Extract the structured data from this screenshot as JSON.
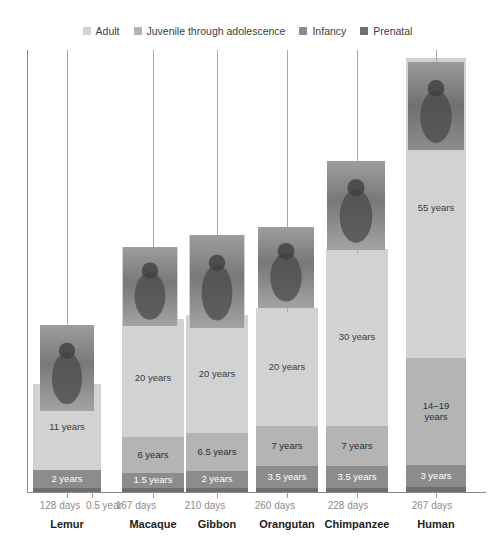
{
  "legend": {
    "items": [
      {
        "label": "Adult",
        "color": "#d2d2d2",
        "name": "adult"
      },
      {
        "label": "Juvenile through adolescence",
        "color": "#b4b4b4",
        "name": "juvenile"
      },
      {
        "label": "Infancy",
        "color": "#8c8c8c",
        "name": "infancy"
      },
      {
        "label": "Prenatal",
        "color": "#6e6e6e",
        "name": "prenatal"
      }
    ]
  },
  "axis": {
    "line_color": "#8a8a8a",
    "tick_color": "#9a9a9a"
  },
  "colors": {
    "adult": "#d2d2d2",
    "juvenile": "#b4b4b4",
    "infancy": "#8c8c8c",
    "prenatal": "#6e6e6e",
    "background": "#ffffff",
    "text": "#3b3b3b",
    "muted_text": "#8d8d8d",
    "leader": "#a8a8a8"
  },
  "chart_data": {
    "type": "bar",
    "subtype": "stacked-bar",
    "title": "",
    "xlabel": "",
    "ylabel": "",
    "grid": false,
    "legend_position": "top-center",
    "unit": "years",
    "categories": [
      "Lemur",
      "Macaque",
      "Gibbon",
      "Orangutan",
      "Chimpanzee",
      "Human"
    ],
    "series": [
      {
        "name": "Adult",
        "values": [
          11,
          20,
          20,
          20,
          30,
          55
        ]
      },
      {
        "name": "Juvenile through adolescence",
        "values": [
          null,
          6,
          6.5,
          7,
          7,
          16.5
        ]
      },
      {
        "name": "Infancy",
        "values": [
          2,
          1.5,
          2,
          3.5,
          3.5,
          3
        ]
      },
      {
        "name": "Prenatal",
        "values": [
          0.35,
          0.457,
          0.575,
          0.712,
          0.625,
          0.731
        ]
      }
    ],
    "prenatal_days": [
      128,
      167,
      210,
      260,
      228,
      267
    ],
    "annotations": [
      {
        "category": "Lemur",
        "extra_tick_label": "0.5 year"
      }
    ]
  },
  "bars": [
    {
      "name": "lemur",
      "species": "Lemur",
      "prenatal_label": "128 days",
      "extra_tick_label": "0.5 year",
      "photo_alt": "lemur-photo",
      "segments": [
        {
          "stage": "adult",
          "label": "11 years",
          "height": 86
        },
        {
          "stage": "infancy",
          "label": "2 years",
          "height": 18
        },
        {
          "stage": "prenatal",
          "label": "128 days",
          "height": 4
        }
      ]
    },
    {
      "name": "macaque",
      "species": "Macaque",
      "prenatal_label": "167 days",
      "photo_alt": "macaque-photo",
      "segments": [
        {
          "stage": "adult",
          "label": "20 years",
          "height": 118
        },
        {
          "stage": "juvenile",
          "label": "6 years",
          "height": 36
        },
        {
          "stage": "infancy",
          "label": "1.5 years",
          "height": 15
        },
        {
          "stage": "prenatal",
          "label": "167 days",
          "height": 4
        }
      ]
    },
    {
      "name": "gibbon",
      "species": "Gibbon",
      "prenatal_label": "210 days",
      "photo_alt": "gibbon-photo",
      "segments": [
        {
          "stage": "adult",
          "label": "20 years",
          "height": 118
        },
        {
          "stage": "juvenile",
          "label": "6.5 years",
          "height": 38
        },
        {
          "stage": "infancy",
          "label": "2 years",
          "height": 17
        },
        {
          "stage": "prenatal",
          "label": "210 days",
          "height": 4
        }
      ]
    },
    {
      "name": "orangutan",
      "species": "Orangutan",
      "prenatal_label": "260 days",
      "photo_alt": "orangutan-photo",
      "segments": [
        {
          "stage": "adult",
          "label": "20 years",
          "height": 118
        },
        {
          "stage": "juvenile",
          "label": "7 years",
          "height": 40
        },
        {
          "stage": "infancy",
          "label": "3.5 years",
          "height": 22
        },
        {
          "stage": "prenatal",
          "label": "260 days",
          "height": 4
        }
      ]
    },
    {
      "name": "chimpanzee",
      "species": "Chimpanzee",
      "prenatal_label": "228 days",
      "photo_alt": "chimpanzee-photo",
      "segments": [
        {
          "stage": "adult",
          "label": "30 years",
          "height": 177
        },
        {
          "stage": "juvenile",
          "label": "7 years",
          "height": 40
        },
        {
          "stage": "infancy",
          "label": "3.5 years",
          "height": 22
        },
        {
          "stage": "prenatal",
          "label": "228 days",
          "height": 4
        }
      ]
    },
    {
      "name": "human",
      "species": "Human",
      "prenatal_label": "267 days",
      "photo_alt": "human-photo",
      "segments": [
        {
          "stage": "adult",
          "label": "55 years",
          "height": 300
        },
        {
          "stage": "juvenile",
          "label": "14–19\nyears",
          "height": 107
        },
        {
          "stage": "infancy",
          "label": "3 years",
          "height": 22
        },
        {
          "stage": "prenatal",
          "label": "267 days",
          "height": 5
        }
      ]
    }
  ],
  "layout": {
    "bar_left": [
      33,
      122,
      186,
      256,
      326,
      406
    ],
    "bar_width": [
      68,
      62,
      62,
      62,
      62,
      60
    ],
    "photo": [
      {
        "left": 40,
        "top": 325,
        "w": 54,
        "h": 86
      },
      {
        "left": 122,
        "top": 247,
        "w": 55,
        "h": 79
      },
      {
        "left": 189,
        "top": 235,
        "w": 55,
        "h": 93
      },
      {
        "left": 258,
        "top": 227,
        "w": 56,
        "h": 81
      },
      {
        "left": 327,
        "top": 161,
        "w": 58,
        "h": 89
      },
      {
        "left": 408,
        "top": 62,
        "w": 56,
        "h": 88
      }
    ],
    "leader_top": 50,
    "ticks": [
      {
        "x": 67,
        "label": "128 days",
        "label_x": 60
      },
      {
        "x": 92,
        "label": "0.5 year",
        "label_x": 104
      },
      {
        "x": 153,
        "label": "167 days",
        "label_x": 136
      },
      {
        "x": 217,
        "label": "210 days",
        "label_x": 205
      },
      {
        "x": 287,
        "label": "260 days",
        "label_x": 275
      },
      {
        "x": 357,
        "label": "228 days",
        "label_x": 348
      },
      {
        "x": 436,
        "label": "267 days",
        "label_x": 432
      }
    ]
  }
}
